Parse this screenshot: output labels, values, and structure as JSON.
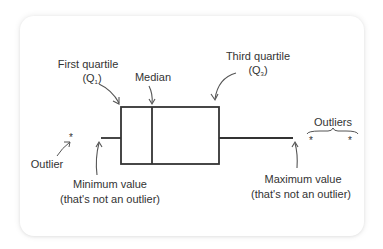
{
  "diagram": {
    "type": "box-plot-anatomy",
    "colors": {
      "background": "#ffffff",
      "card": "#ffffff",
      "stroke": "#333333",
      "arrow": "#555555",
      "text": "#333333"
    },
    "labels": {
      "first_quartile": "First quartile",
      "first_quartile_symbol": "(Q",
      "first_quartile_sub": "1",
      "first_quartile_close": ")",
      "median": "Median",
      "third_quartile": "Third quartile",
      "third_quartile_symbol": "(Q",
      "third_quartile_sub": "3",
      "third_quartile_close": ")",
      "outlier": "Outlier",
      "outliers": "Outliers",
      "minimum_line1": "Minimum value",
      "minimum_line2": "(that's not an outlier)",
      "maximum_line1": "Maximum value",
      "maximum_line2": "(that's not an outlier)"
    },
    "markers": {
      "outlier_symbol": "*"
    }
  }
}
